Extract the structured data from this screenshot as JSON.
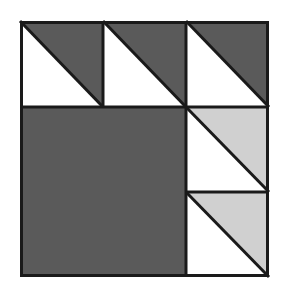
{
  "figure": {
    "title": "Quilt Block Pattern",
    "type": "geometric-quilt-block",
    "canvas": {
      "width": 281,
      "height": 299,
      "background": "#ffffff"
    },
    "block": {
      "label": "Half-Square-Triangle Quilt Block",
      "x": 20,
      "y": 21,
      "width": 249,
      "height": 256,
      "border_color": "#1a1a1a",
      "border_width": 3
    },
    "palette": {
      "dark_gray": "#5a5a5a",
      "light_gray": "#d0d0d0",
      "white": "#ffffff",
      "line": "#1a1a1a",
      "background": "#ffffff"
    },
    "grid": {
      "columns": 3,
      "rows": 3,
      "column_edges": [
        20,
        103,
        186,
        269
      ],
      "row_edges": [
        21,
        107,
        192,
        277
      ]
    },
    "units": [
      {
        "name": "top-left-hst",
        "row": 1,
        "col": 1,
        "kind": "half-square-triangle",
        "triangle_position": "upper-right",
        "triangle_color": "#5a5a5a",
        "ground_color": "#ffffff",
        "x": 20,
        "y": 21,
        "width": 83,
        "height": 86
      },
      {
        "name": "top-center-hst",
        "row": 1,
        "col": 2,
        "kind": "half-square-triangle",
        "triangle_position": "upper-right",
        "triangle_color": "#5a5a5a",
        "ground_color": "#ffffff",
        "x": 103,
        "y": 21,
        "width": 83,
        "height": 86
      },
      {
        "name": "top-right-hst",
        "row": 1,
        "col": 3,
        "kind": "half-square-triangle",
        "triangle_position": "upper-right",
        "triangle_color": "#5a5a5a",
        "ground_color": "#ffffff",
        "x": 186,
        "y": 21,
        "width": 83,
        "height": 86
      },
      {
        "name": "large-dark-square",
        "row": "2-3",
        "col": "1-2",
        "kind": "solid-square",
        "triangle_position": "none",
        "triangle_color": "#5a5a5a",
        "ground_color": "#5a5a5a",
        "x": 20,
        "y": 107,
        "width": 166,
        "height": 170
      },
      {
        "name": "middle-right-hst",
        "row": 2,
        "col": 3,
        "kind": "half-square-triangle",
        "triangle_position": "upper-right",
        "triangle_color": "#d0d0d0",
        "ground_color": "#ffffff",
        "x": 186,
        "y": 107,
        "width": 83,
        "height": 85
      },
      {
        "name": "bottom-right-hst",
        "row": 3,
        "col": 3,
        "kind": "half-square-triangle",
        "triangle_position": "upper-right",
        "triangle_color": "#d0d0d0",
        "ground_color": "#ffffff",
        "x": 186,
        "y": 192,
        "width": 83,
        "height": 85
      }
    ]
  }
}
